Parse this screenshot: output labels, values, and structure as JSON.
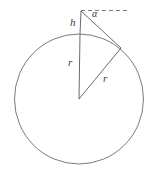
{
  "figure": {
    "kind": "geometry-diagram",
    "background_color": "#ffffff",
    "stroke_color": "#555555",
    "label_color": "#3a3a3a",
    "labels": {
      "height": "h",
      "radius_vertical": "r",
      "radius_slant": "r",
      "angle": "α"
    },
    "geometry": {
      "circle": {
        "center_x": 79,
        "center_y": 99,
        "radius": 64.5
      },
      "apex": {
        "x": 81,
        "y": 11
      },
      "circle_top": {
        "x": 80,
        "y": 34.5
      },
      "tangent_point": {
        "x": 121,
        "y": 48
      },
      "dashed_line": {
        "x1": 81,
        "y1": 10.5,
        "x2": 128,
        "y2": 10.5
      }
    }
  }
}
